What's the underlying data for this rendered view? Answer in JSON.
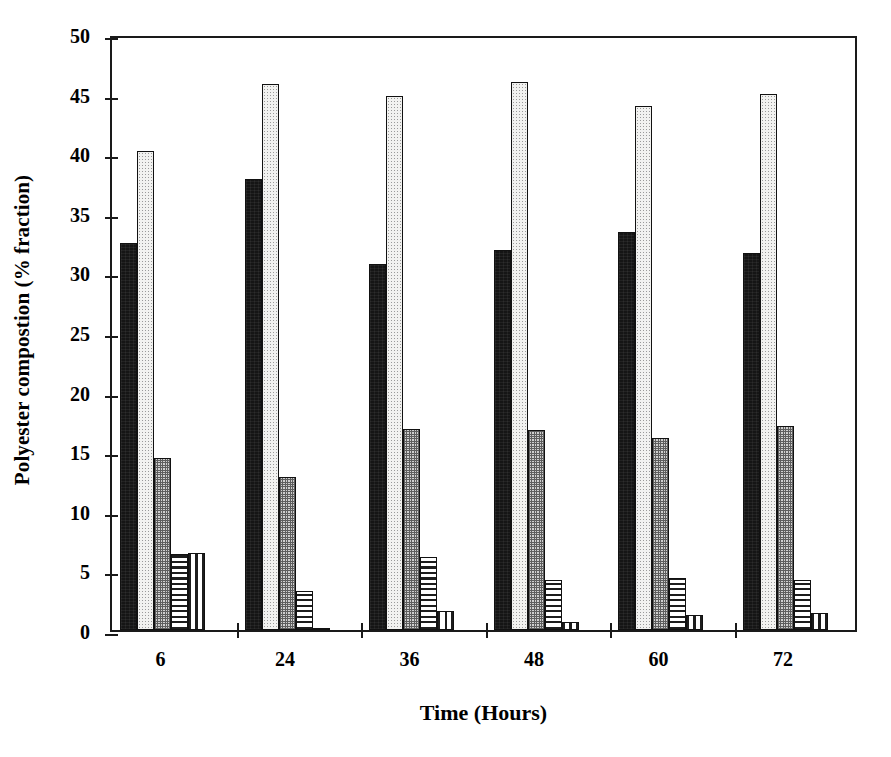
{
  "chart_data": {
    "type": "bar",
    "title": "",
    "xlabel": "Time (Hours)",
    "ylabel": "Polyester compostion (% fraction)",
    "categories": [
      "6",
      "24",
      "36",
      "48",
      "60",
      "72"
    ],
    "ylim": [
      0,
      50
    ],
    "yticks": [
      0,
      5,
      10,
      15,
      20,
      25,
      30,
      35,
      40,
      45,
      50
    ],
    "ytick_labels": [
      "0",
      "5",
      "10",
      "15",
      "20",
      "25",
      "30",
      "35",
      "40",
      "45",
      "50"
    ],
    "grid": false,
    "legend": "none",
    "series": [
      {
        "name": "series-1",
        "pattern": "solid-black",
        "values": [
          32.5,
          37.8,
          30.7,
          31.9,
          33.4,
          31.6
        ]
      },
      {
        "name": "series-2",
        "pattern": "light-dots",
        "values": [
          40.2,
          45.8,
          44.8,
          46.0,
          44.0,
          45.0
        ]
      },
      {
        "name": "series-3",
        "pattern": "grey-hatch",
        "values": [
          14.4,
          12.8,
          16.9,
          16.8,
          16.1,
          17.1
        ]
      },
      {
        "name": "series-4",
        "pattern": "horizontal-lines",
        "values": [
          6.4,
          3.3,
          6.1,
          4.2,
          4.4,
          4.2
        ]
      },
      {
        "name": "series-5",
        "pattern": "vertical-lines",
        "values": [
          6.5,
          0.2,
          1.6,
          0.7,
          1.3,
          1.4
        ]
      }
    ],
    "colors": {
      "axis": "#1a1a1a",
      "series-1": "#151515",
      "series-2": "#f2f2f0",
      "series-3": "#cfcfcf",
      "series-4": "#ffffff",
      "series-5": "#ffffff"
    }
  }
}
